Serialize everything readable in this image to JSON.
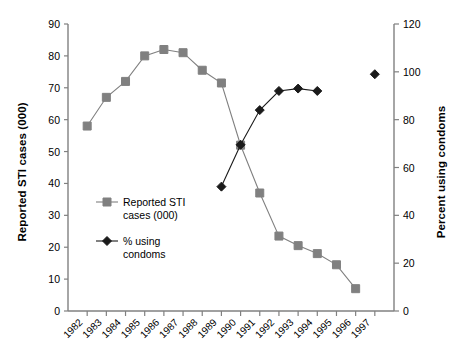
{
  "chart_data": {
    "type": "line",
    "title": "",
    "xlabel": "",
    "ylabel": "Reported STI cases (000)",
    "y2label": "Percent using condoms",
    "categories": [
      "1982",
      "1983",
      "1984",
      "1985",
      "1986",
      "1987",
      "1988",
      "1989",
      "1990",
      "1991",
      "1992",
      "1993",
      "1994",
      "1995",
      "1996",
      "1997"
    ],
    "ylim": [
      0,
      90
    ],
    "yticks": [
      0,
      10,
      20,
      30,
      40,
      50,
      60,
      70,
      80,
      90
    ],
    "y2lim": [
      0,
      120
    ],
    "y2ticks": [
      0,
      20,
      40,
      60,
      80,
      100,
      120
    ],
    "grid": false,
    "legend_position": "inside-left",
    "series": [
      {
        "name": "Reported STI cases (000)",
        "axis": "left",
        "marker": "square",
        "color": "#808080",
        "x": [
          "1982",
          "1983",
          "1984",
          "1985",
          "1986",
          "1987",
          "1988",
          "1989",
          "1990",
          "1991",
          "1992",
          "1993",
          "1994",
          "1995",
          "1996"
        ],
        "values": [
          58,
          67,
          72,
          80,
          82,
          81,
          75.5,
          71.5,
          52,
          37,
          23.5,
          20.5,
          18,
          14.5,
          7
        ]
      },
      {
        "name": "% using condoms",
        "axis": "right",
        "marker": "diamond",
        "color": "#1a1a1a",
        "x": [
          "1989",
          "1990",
          "1991",
          "1992",
          "1993",
          "1994",
          "1997"
        ],
        "values": [
          52,
          69.5,
          84,
          92,
          93,
          92,
          99
        ]
      }
    ]
  },
  "legend": {
    "entries": [
      {
        "label_line1": "Reported STI",
        "label_line2": "cases (000)",
        "marker": "square",
        "color": "#808080"
      },
      {
        "label_line1": "% using",
        "label_line2": "condoms",
        "marker": "diamond",
        "color": "#1a1a1a"
      }
    ]
  },
  "axes": {
    "left_title": "Reported STI cases (000)",
    "right_title": "Percent using condoms"
  }
}
